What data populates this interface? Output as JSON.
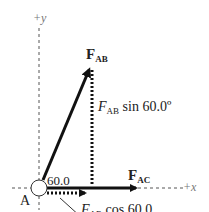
{
  "axes": {
    "y_label": "+y",
    "x_label": "+x"
  },
  "point": {
    "label": "A"
  },
  "angle": {
    "label": "60.0"
  },
  "forces": {
    "fab": {
      "main": "F",
      "sub": "AB"
    },
    "fac": {
      "main": "F",
      "sub": "AC"
    }
  },
  "components": {
    "vertical": {
      "main": "F",
      "sub": "AB",
      "rest": " sin 60.0º"
    },
    "horizontal": {
      "main": "F",
      "sub": "AB",
      "rest": " cos 60.0"
    }
  },
  "colors": {
    "ink": "#111111",
    "axis": "#555555"
  }
}
